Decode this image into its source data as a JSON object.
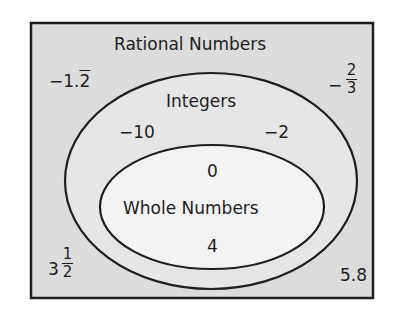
{
  "diagram": {
    "type": "venn-nested",
    "colors": {
      "background": "#ffffff",
      "universe_fill": "#dcdcdc",
      "integers_fill": "#e6e6e6",
      "whole_fill": "#f3f3f3",
      "stroke": "#1e1e1e"
    },
    "sets": {
      "rational": {
        "label": "Rational Numbers",
        "members": [
          {
            "text": "−1.2",
            "repeat_digit": "2",
            "prefix": "−1."
          },
          {
            "text": "−2/3",
            "sign": "−",
            "numerator": "2",
            "denominator": "3"
          },
          {
            "text": "3 1/2",
            "whole": "3",
            "numerator": "1",
            "denominator": "2"
          },
          {
            "text": "5.8"
          }
        ]
      },
      "integers": {
        "label": "Integers",
        "members": [
          "−10",
          "−2"
        ]
      },
      "whole": {
        "label": "Whole Numbers",
        "members": [
          "0",
          "4"
        ]
      }
    }
  }
}
